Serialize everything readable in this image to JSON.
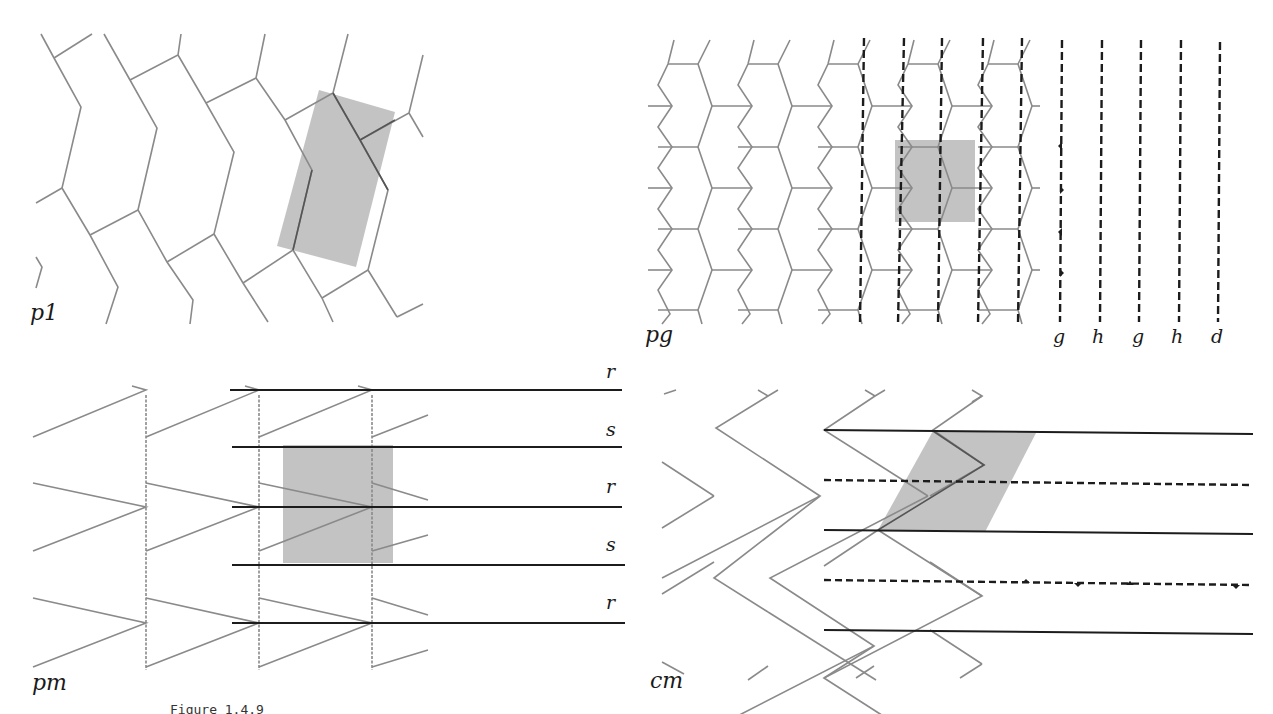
{
  "figure": {
    "caption": "Figure 1.4.9"
  },
  "panels": {
    "p1": {
      "label": "p1",
      "description": "Oblique hexagonal-like tiling with shaded fundamental parallelogram",
      "cell_color": "#b8b8b8"
    },
    "pg": {
      "label": "pg",
      "description": "Tiling with vertical glide-reflection axes (dashed) and shaded rectangular cell",
      "axis_labels": [
        "g",
        "h",
        "g",
        "h",
        "d"
      ],
      "cell_color": "#b8b8b8"
    },
    "pm": {
      "label": "pm",
      "description": "Chevron motifs with horizontal mirror lines and shaded rectangular cell",
      "line_labels": [
        "r",
        "s",
        "r",
        "s",
        "r"
      ],
      "cell_color": "#b8b8b8"
    },
    "cm": {
      "label": "cm",
      "description": "Herringbone tiling with mirror lines (solid), glide lines (dashed) and shaded rhombic cell",
      "cell_color": "#b8b8b8"
    }
  },
  "colors": {
    "edge": "#8a8a8a",
    "axis": "#1c1c1c",
    "shade": "#b8b8b8",
    "background": "#ffffff"
  }
}
